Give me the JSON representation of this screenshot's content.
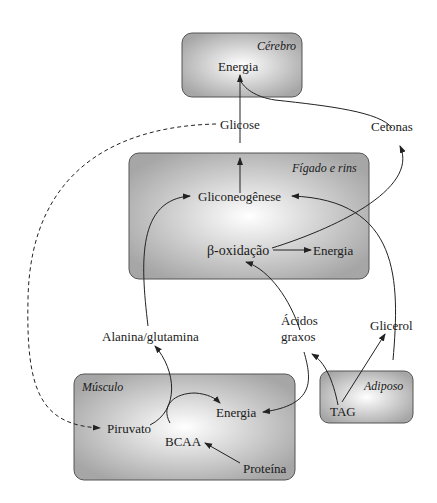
{
  "boxes": {
    "brain": {
      "title": "Cérebro",
      "energy": "Energia"
    },
    "liver": {
      "title": "Fígado e rins",
      "gluconeogenesis": "Gliconeogênese",
      "beta_oxidation": "β-oxidação",
      "energy": "Energia"
    },
    "muscle": {
      "title": "Músculo",
      "pyruvate": "Piruvato",
      "bcaa": "BCAA",
      "energy": "Energia",
      "protein": "Proteína"
    },
    "adipose": {
      "title": "Adiposo",
      "tag": "TAG"
    }
  },
  "labels": {
    "glucose": "Glicose",
    "ketones": "Cetonas",
    "alanine_glutamine": "Alanina/glutamina",
    "fatty_acids_line1": "Ácidos",
    "fatty_acids_line2": "graxos",
    "glycerol": "Glicerol"
  },
  "colors": {
    "box_fill_edge": "#a9a9a9",
    "box_fill_center": "#ffffff",
    "box_stroke": "#555555",
    "line": "#222222"
  }
}
